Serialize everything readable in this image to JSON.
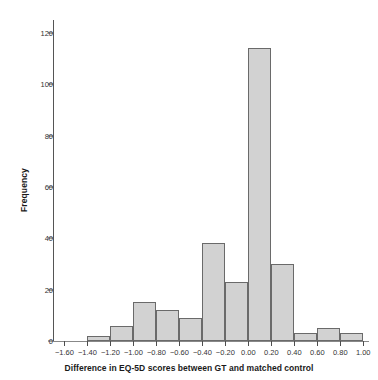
{
  "chart_data": {
    "type": "bar",
    "title": "",
    "xlabel": "Difference in EQ-5D scores between GT and matched control",
    "ylabel": "Frequency",
    "xlim": [
      -1.7,
      1.05
    ],
    "ylim": [
      0,
      125
    ],
    "grid": false,
    "legend": null,
    "bin_width": 0.2,
    "bin_edges": [
      -1.4,
      -1.2,
      -1.0,
      -0.8,
      -0.6,
      -0.4,
      -0.2,
      0.0,
      0.2,
      0.4,
      0.6,
      0.8,
      1.0
    ],
    "categories": [
      "-1.40 to -1.20",
      "-1.20 to -1.00",
      "-1.00 to -0.80",
      "-0.80 to -0.60",
      "-0.60 to -0.40",
      "-0.40 to -0.20",
      "-0.20 to 0.00",
      "0.00 to 0.20",
      "0.20 to 0.40",
      "0.40 to 0.60",
      "0.60 to 0.80",
      "0.80 to 1.00"
    ],
    "values": [
      2,
      6,
      15,
      12,
      9,
      38,
      23,
      114,
      30,
      3,
      5,
      3
    ],
    "bars": [
      {
        "left": -1.4,
        "right": -1.2,
        "value": 2
      },
      {
        "left": -1.2,
        "right": -1.0,
        "value": 6
      },
      {
        "left": -1.0,
        "right": -0.8,
        "value": 15
      },
      {
        "left": -0.8,
        "right": -0.6,
        "value": 12
      },
      {
        "left": -0.6,
        "right": -0.4,
        "value": 9
      },
      {
        "left": -0.4,
        "right": -0.2,
        "value": 38
      },
      {
        "left": -0.2,
        "right": 0.0,
        "value": 23
      },
      {
        "left": 0.0,
        "right": 0.2,
        "value": 114
      },
      {
        "left": 0.2,
        "right": 0.4,
        "value": 30
      },
      {
        "left": 0.4,
        "right": 0.6,
        "value": 3
      },
      {
        "left": 0.6,
        "right": 0.8,
        "value": 5
      },
      {
        "left": 0.8,
        "right": 1.0,
        "value": 3
      }
    ],
    "xticks": [
      -1.6,
      -1.4,
      -1.2,
      -1.0,
      -0.8,
      -0.6,
      -0.4,
      -0.2,
      0.0,
      0.2,
      0.4,
      0.6,
      0.8,
      1.0
    ],
    "xticklabels": [
      "−1.60",
      "−1.40",
      "−1.20",
      "−1.00",
      "−0.80",
      "−0.60",
      "−0.40",
      "−0.20",
      "0.00",
      "0.20",
      "0.40",
      "0.60",
      "0.80",
      "1.00"
    ],
    "yticks": [
      0,
      20,
      40,
      60,
      80,
      100,
      120
    ],
    "yticklabels": [
      "0",
      "20",
      "40",
      "60",
      "80",
      "100",
      "120"
    ],
    "colors": {
      "bar_fill": "#d2d2d2",
      "bar_edge": "#6a6a6a",
      "axis": "#555555",
      "text": "#1a1a1a",
      "background": "#ffffff"
    }
  }
}
